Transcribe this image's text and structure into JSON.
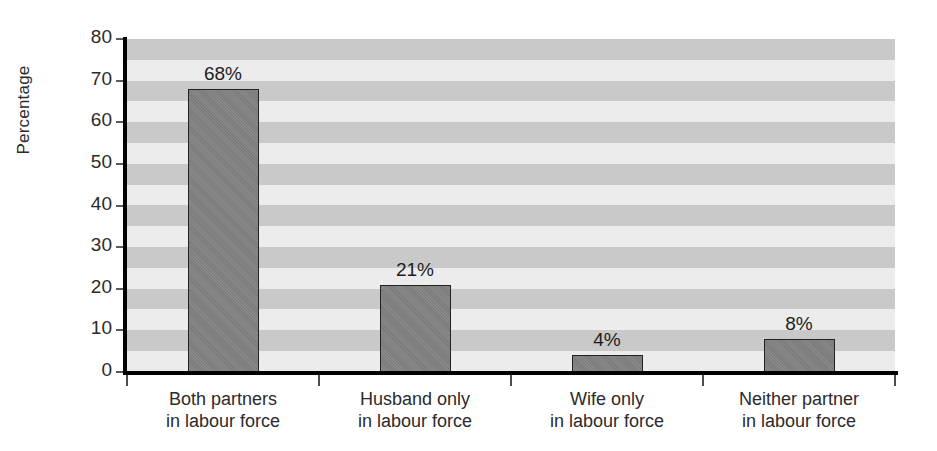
{
  "chart_data": {
    "type": "bar",
    "title": "",
    "xlabel": "",
    "ylabel": "Percentage",
    "categories": [
      "Both partners\nin labour force",
      "Husband only\nin labour force",
      "Wife only\nin labour force",
      "Neither partner\nin labour force"
    ],
    "category_lines": [
      [
        "Both partners",
        "in labour force"
      ],
      [
        "Husband only",
        "in labour force"
      ],
      [
        "Wife only",
        "in labour force"
      ],
      [
        "Neither partner",
        "in labour force"
      ]
    ],
    "values": [
      68,
      21,
      4,
      8
    ],
    "value_labels": [
      "68%",
      "21%",
      "4%",
      "8%"
    ],
    "ylim": [
      0,
      80
    ],
    "ytick_values": [
      0,
      10,
      20,
      30,
      40,
      50,
      60,
      70,
      80
    ],
    "ytick_labels": [
      "0",
      "10",
      "20",
      "30",
      "40",
      "50",
      "60",
      "70",
      "80"
    ],
    "grid": "horizontal-alternating-bands",
    "band_step": 5,
    "legend": "none",
    "colors": {
      "bar_fill": "#808080",
      "bar_border": "#222222",
      "band_dark": "#c9c9c9",
      "band_light": "#ececec",
      "axis": "#000000",
      "text": "#2b2b2b"
    }
  },
  "axis": {
    "y_title": "Percentage"
  }
}
